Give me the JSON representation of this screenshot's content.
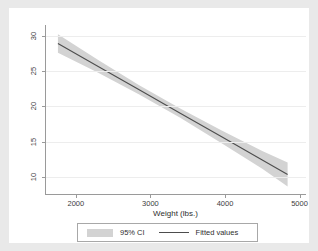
{
  "chart_data": {
    "type": "line",
    "title": "",
    "subtitle": "",
    "xlabel": "Weight (lbs.)",
    "ylabel": "",
    "xlim": [
      1600,
      5100
    ],
    "ylim": [
      7.5,
      31.5
    ],
    "xticks": [
      2000,
      3000,
      4000,
      5000
    ],
    "xticklabels": [
      "2000",
      "3000",
      "4000",
      "5000"
    ],
    "yticks": [
      10,
      15,
      20,
      25,
      30
    ],
    "yticklabels": [
      "10",
      "15",
      "20",
      "25",
      "30"
    ],
    "grid": "horizontal",
    "legend_position": "bottom",
    "series": [
      {
        "name": "Fitted values",
        "type": "line",
        "color": "#4d4d4d",
        "x": [
          1760,
          2300,
          2850,
          3400,
          3950,
          4500,
          4840
        ],
        "values": [
          28.9,
          25.65,
          22.35,
          19.05,
          15.75,
          12.45,
          10.4
        ]
      },
      {
        "name": "95% CI",
        "type": "band",
        "color": "#d3d3d3",
        "x": [
          1760,
          2300,
          2850,
          3400,
          3950,
          4500,
          4840
        ],
        "lower": [
          27.6,
          24.75,
          21.7,
          18.4,
          14.85,
          11.2,
          8.7
        ],
        "upper": [
          30.2,
          26.55,
          23.0,
          19.7,
          16.65,
          13.7,
          12.1
        ]
      }
    ]
  },
  "legend": {
    "items": [
      {
        "label": "95% CI",
        "marker": "band-swatch"
      },
      {
        "label": "Fitted values",
        "marker": "line-swatch"
      }
    ]
  },
  "colors": {
    "band": "#d3d3d3",
    "line": "#4d4d4d",
    "axis": "#9a9a9a",
    "grid": "#ededed",
    "canvas": "#ffffff",
    "background": "#e9e9e9"
  }
}
